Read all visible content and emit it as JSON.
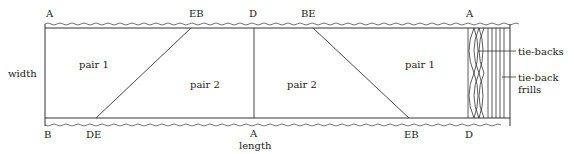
{
  "diagram": {
    "type": "curtain fabric cutting layout",
    "corner_labels_top": [
      "A",
      "EB",
      "D",
      "BE",
      "A"
    ],
    "corner_labels_bottom": [
      "B",
      "DE",
      "A",
      "EB",
      "D"
    ],
    "axis_labels": {
      "width": "width",
      "length": "length"
    },
    "panels": [
      {
        "label": "pair 1"
      },
      {
        "label": "pair 2"
      },
      {
        "label": "pair 2"
      },
      {
        "label": "pair 1"
      }
    ],
    "annotations": [
      "tie-backs",
      "tie-back frills"
    ],
    "annotation_lines": {
      "tie_backs": "tie-backs",
      "tie_back_frills_1": "tie-back",
      "tie_back_frills_2": "frills"
    },
    "colors": {
      "line": "#333333",
      "background": "#ffffff"
    }
  }
}
